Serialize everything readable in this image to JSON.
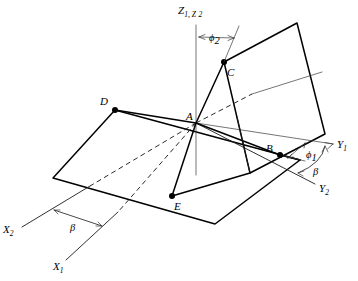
{
  "figure": {
    "background_color": "#ffffff",
    "line_color": "#000000",
    "width": 358,
    "height": 281
  },
  "axes": [
    {
      "id": "z",
      "label": "Z",
      "sub": "1, Z",
      "sub2": "2",
      "label_full": "Z1, Z2",
      "x": 252,
      "y": 11
    },
    {
      "id": "y1",
      "label": "Y",
      "sub": "1",
      "x": 340,
      "y": 145
    },
    {
      "id": "y2",
      "label": "Y",
      "sub": "2",
      "x": 322,
      "y": 190
    },
    {
      "id": "x1",
      "label": "X",
      "sub": "1",
      "x": 55,
      "y": 268
    },
    {
      "id": "x2",
      "label": "X",
      "sub": "2",
      "x": 5,
      "y": 232
    }
  ],
  "points": [
    {
      "id": "A",
      "label": "A",
      "x": 196,
      "y": 123,
      "label_x": 186,
      "label_y": 120,
      "has_dot": false
    },
    {
      "id": "B",
      "label": "B",
      "x": 280,
      "y": 155,
      "label_x": 268,
      "label_y": 151,
      "has_dot": true
    },
    {
      "id": "C",
      "label": "C",
      "x": 224,
      "y": 62,
      "label_x": 227,
      "label_y": 75,
      "has_dot": true
    },
    {
      "id": "D",
      "label": "D",
      "x": 115,
      "y": 110,
      "label_x": 101,
      "label_y": 105,
      "has_dot": true
    },
    {
      "id": "E",
      "label": "E",
      "x": 172,
      "y": 196,
      "label_x": 175,
      "label_y": 209,
      "has_dot": true
    }
  ],
  "angles": [
    {
      "id": "phi2",
      "label": "ϕ",
      "sub": "2",
      "x": 216,
      "y": 38,
      "type": "double-arrow-linear"
    },
    {
      "id": "phi1",
      "label": "ϕ",
      "sub": "1",
      "x": 310,
      "y": 154,
      "type": "double-arrow-linear"
    },
    {
      "id": "beta_right",
      "label": "β",
      "sub": "",
      "x": 316,
      "y": 173,
      "type": "curved-arc"
    },
    {
      "id": "beta_left",
      "label": "β",
      "sub": "",
      "x": 72,
      "y": 229,
      "type": "curved-arc"
    }
  ],
  "planes": [
    {
      "id": "plane1",
      "name": "horizontal-plane",
      "vertices": [
        [
          115,
          110
        ],
        [
          53,
          178
        ],
        [
          215,
          224
        ],
        [
          300,
          160
        ]
      ],
      "style": "solid"
    },
    {
      "id": "plane2",
      "name": "tilted-plane",
      "vertices": [
        [
          224,
          62
        ],
        [
          297,
          23
        ],
        [
          325,
          134
        ],
        [
          250,
          173
        ]
      ],
      "style": "solid"
    }
  ],
  "dashed_lines": [
    {
      "id": "dash-x2",
      "from": [
        196,
        123
      ],
      "to": [
        52,
        206
      ]
    },
    {
      "id": "dash-x1",
      "from": [
        196,
        123
      ],
      "to": [
        115,
        215
      ]
    },
    {
      "id": "dash-up-right",
      "from": [
        196,
        123
      ],
      "to": [
        255,
        92
      ]
    }
  ]
}
